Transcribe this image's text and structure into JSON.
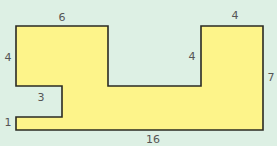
{
  "diagram": {
    "type": "rectilinear-compound-shape",
    "colors": {
      "background": "#ddf0e4",
      "fill": "#fdf48a",
      "stroke": "#2a2a22",
      "label": "#555555"
    },
    "vertices": [
      [
        16,
        26
      ],
      [
        108,
        26
      ],
      [
        108,
        86
      ],
      [
        201,
        86
      ],
      [
        201,
        26
      ],
      [
        263,
        26
      ],
      [
        263,
        130
      ],
      [
        16,
        130
      ],
      [
        16,
        117
      ],
      [
        62,
        117
      ],
      [
        62,
        86
      ],
      [
        16,
        86
      ]
    ],
    "labels": {
      "top_left_width": "6",
      "left_height": "4",
      "notch_width": "3",
      "bottom_left_height": "1",
      "bottom_width": "16",
      "right_block_inner_height": "4",
      "right_block_width": "4",
      "right_height": "7"
    }
  }
}
